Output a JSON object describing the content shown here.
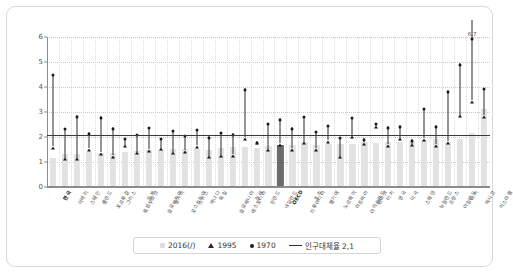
{
  "chart_data": {
    "type": "bar",
    "title": "",
    "xlabel": "",
    "ylabel": "",
    "ylim": [
      0,
      6
    ],
    "yticks": [
      0,
      1,
      2,
      3,
      4,
      5,
      6
    ],
    "grid": true,
    "legend_position": "bottom",
    "reference_line": {
      "label": "인구대체율 2,1",
      "value": 2.1
    },
    "annotations": [
      {
        "category": "멕시코",
        "series": "1970",
        "text": "6,7",
        "value": 6.7
      }
    ],
    "categories": [
      "한국",
      "이태리",
      "스페인",
      "폴란드",
      "포르투갈",
      "그리스",
      "룩셈부르크",
      "일본",
      "슬로바키아",
      "헝가리",
      "오스트리아",
      "스위스",
      "캐나다",
      "독일",
      "슬로베니아",
      "에스토니아",
      "칠레",
      "핀란드",
      "네덜란드",
      "OECD",
      "리투아니아",
      "호주",
      "벨기에",
      "노르웨이",
      "라트비아",
      "아이슬란드",
      "덴마크",
      "터키",
      "영국",
      "미국",
      "스웨덴",
      "뉴질랜드",
      "프랑스",
      "아일랜드",
      "터키",
      "멕시코",
      "이스라엘"
    ],
    "series": [
      {
        "name": "2016(/)",
        "type": "bar",
        "color": "#e2e2e2",
        "highlight_color": "#6b6b6b",
        "highlight_category": "OECD",
        "values": [
          1.17,
          1.34,
          1.34,
          1.39,
          1.36,
          1.38,
          1.41,
          1.44,
          1.48,
          1.49,
          1.53,
          1.54,
          1.54,
          1.5,
          1.58,
          1.6,
          1.62,
          1.57,
          1.66,
          1.68,
          1.69,
          1.79,
          1.68,
          1.71,
          1.74,
          1.74,
          1.79,
          1.75,
          1.79,
          1.8,
          1.85,
          1.87,
          1.92,
          1.81,
          1.92,
          2.18,
          3.11
        ]
      },
      {
        "name": "1995",
        "type": "marker-triangle",
        "color": "#1a1a1a",
        "values": [
          1.63,
          1.18,
          1.17,
          1.55,
          1.4,
          1.28,
          1.69,
          1.42,
          1.52,
          1.57,
          1.42,
          1.48,
          1.67,
          1.25,
          1.29,
          1.32,
          2.0,
          1.81,
          1.53,
          1.76,
          1.55,
          1.82,
          1.55,
          1.87,
          1.25,
          2.08,
          1.8,
          2.46,
          1.71,
          1.98,
          1.73,
          1.96,
          1.71,
          1.84,
          2.9,
          3.47,
          2.87
        ]
      },
      {
        "name": "1970",
        "type": "marker-dot",
        "color": "#1a1a1a",
        "values": [
          4.53,
          2.38,
          2.88,
          2.2,
          2.83,
          2.4,
          1.97,
          2.13,
          2.41,
          1.98,
          2.29,
          2.1,
          2.33,
          2.03,
          2.21,
          2.16,
          3.95,
          1.83,
          2.57,
          2.76,
          2.4,
          2.86,
          2.25,
          2.5,
          2.01,
          2.81,
          1.95,
          2.57,
          2.44,
          2.48,
          1.92,
          3.17,
          2.48,
          3.87,
          4.95,
          6.7,
          3.97
        ]
      }
    ]
  },
  "legend": {
    "items": [
      {
        "icon": "square-swatch",
        "label": "2016(/)"
      },
      {
        "icon": "triangle-swatch",
        "label": "1995"
      },
      {
        "icon": "dot-swatch",
        "label": "1970"
      },
      {
        "icon": "line-swatch",
        "label": "인구대체율 2,1"
      }
    ]
  }
}
